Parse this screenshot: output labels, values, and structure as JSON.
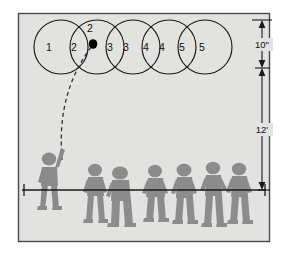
{
  "diagram": {
    "background_color": "#e2e2e0",
    "border_color": "#4a4a4a",
    "line_color": "#1a1a1a",
    "figure_color": "#8c8c8c",
    "ball_color": "#000000"
  },
  "ball_positions": {
    "count": 5,
    "labels": [
      "1",
      "2",
      "2",
      "3",
      "3",
      "4",
      "4",
      "5",
      "5"
    ],
    "circles": [
      {
        "label_left": "1",
        "label_right": "2",
        "cx": 55,
        "cy": 47,
        "r": 25
      },
      {
        "label_left": "2",
        "label_right": "3",
        "cx": 96,
        "cy": 47,
        "r": 25
      },
      {
        "label_left": "3",
        "label_right": "4",
        "cx": 138,
        "cy": 47,
        "r": 25
      },
      {
        "label_left": "4",
        "label_right": "5",
        "cx": 180,
        "cy": 47,
        "r": 25
      },
      {
        "label_left": "5",
        "label_right": "",
        "cx": 199,
        "cy": 47,
        "r": 25
      }
    ],
    "label_items": [
      {
        "text": "1",
        "x": 49,
        "y": 48
      },
      {
        "text": "2",
        "x": 74,
        "y": 48
      },
      {
        "text": "2",
        "x": 90,
        "y": 29
      },
      {
        "text": "3",
        "x": 108,
        "y": 48
      },
      {
        "text": "3",
        "x": 124,
        "y": 48
      },
      {
        "text": "4",
        "x": 142,
        "y": 48
      },
      {
        "text": "4",
        "x": 159,
        "y": 48
      },
      {
        "text": "5",
        "x": 176,
        "y": 48
      },
      {
        "text": "5",
        "x": 198,
        "y": 48
      }
    ]
  },
  "ball_marker": {
    "label": "2",
    "cx": 93,
    "cy": 44,
    "r": 4.2
  },
  "dimensions": {
    "upper": {
      "value": "10",
      "unit": "\"",
      "label": "10\"",
      "top_y": 20,
      "bottom_y": 68
    },
    "lower": {
      "value": "12",
      "unit": "'",
      "label": "12'",
      "top_y": 68,
      "bottom_y": 190
    },
    "axis_x": 262
  },
  "ground": {
    "line_y": 190,
    "x_start": 22,
    "x_end": 266,
    "tick_left_x": 24,
    "tick_right_x": 264
  },
  "people": {
    "shooter": {
      "label": "shooter",
      "x": 42,
      "baseline": 190
    },
    "defenders_count": 6,
    "defenders": [
      {
        "label": "defender-1",
        "x": 92
      },
      {
        "label": "defender-2",
        "x": 118
      },
      {
        "label": "defender-3",
        "x": 152
      },
      {
        "label": "defender-4",
        "x": 181
      },
      {
        "label": "defender-5",
        "x": 212
      },
      {
        "label": "defender-6",
        "x": 238
      }
    ]
  },
  "trajectory": {
    "name": "shot-arc",
    "style": "dashed",
    "path": "M 62 160 C 60 120, 66 86, 93 44"
  }
}
